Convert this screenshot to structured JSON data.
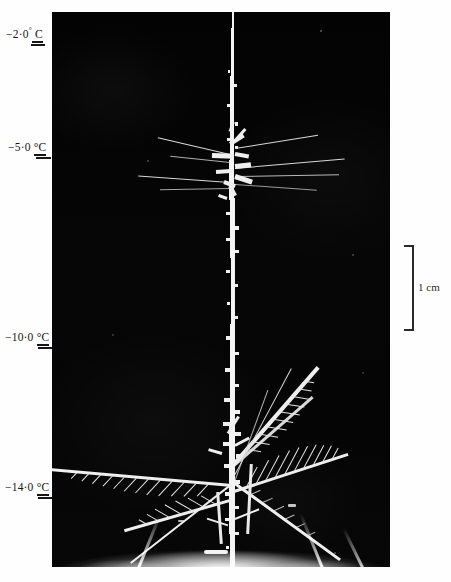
{
  "figure": {
    "type": "photomicrograph",
    "background_color": "#040404",
    "crystal_color": "#f4f4f4",
    "label_color": "#151515"
  },
  "temperature_scale": {
    "unit": "°C",
    "labels": [
      {
        "value": "−2·0",
        "degree": "°",
        "unit": " C",
        "text": "−2·0° C",
        "y": 33
      },
      {
        "value": "−5·0",
        "degree": "",
        "unit": "°C",
        "text": "−5·0 °C",
        "y": 148
      },
      {
        "value": "−10·0",
        "degree": "",
        "unit": "°C",
        "text": "−10·0 °C",
        "y": 338
      },
      {
        "value": "−14·0",
        "degree": "",
        "unit": "°C",
        "text": "−14·0 °C",
        "y": 488
      }
    ]
  },
  "scale_bar": {
    "label": "1 cm",
    "orientation": "vertical",
    "bracket_top_y": 245,
    "bracket_bottom_y": 331,
    "x": 404
  },
  "photo": {
    "left": 52,
    "top": 12,
    "width": 338,
    "height": 555
  }
}
